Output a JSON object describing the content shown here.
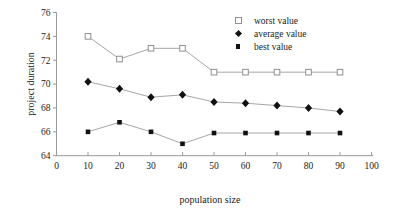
{
  "figure": {
    "ylabel": "project duration",
    "xlabel": "population size"
  },
  "legend": {
    "items": [
      {
        "label": "worst value",
        "marker": "open-square"
      },
      {
        "label": "average value",
        "marker": "filled-diamond"
      },
      {
        "label": "best value",
        "marker": "filled-square"
      }
    ]
  },
  "chart_data": {
    "type": "line",
    "x": [
      10,
      20,
      30,
      40,
      50,
      60,
      70,
      80,
      90
    ],
    "series": [
      {
        "name": "worst value",
        "marker": "open-square",
        "values": [
          74,
          72.1,
          73,
          73,
          71,
          71,
          71,
          71,
          71
        ]
      },
      {
        "name": "average value",
        "marker": "filled-diamond",
        "values": [
          70.2,
          69.6,
          68.9,
          69.1,
          68.5,
          68.4,
          68.2,
          68.0,
          67.7
        ]
      },
      {
        "name": "best value",
        "marker": "filled-square",
        "values": [
          66.0,
          66.8,
          66.0,
          65.0,
          65.9,
          65.9,
          65.9,
          65.9,
          65.9
        ]
      }
    ],
    "title": "",
    "xlabel": "population size",
    "ylabel": "project duration",
    "xlim": [
      0,
      100
    ],
    "ylim": [
      64,
      76
    ],
    "xticks": [
      0,
      10,
      20,
      30,
      40,
      50,
      60,
      70,
      80,
      90,
      100
    ],
    "yticks": [
      64,
      66,
      68,
      70,
      72,
      74,
      76
    ],
    "grid": false,
    "legend_position": "top-right",
    "colors": {
      "axis": "#999999",
      "line": "#a6a6a6",
      "open_marker_stroke": "#8f8f8f",
      "filled_marker": "#111111",
      "text": "#222222"
    }
  }
}
